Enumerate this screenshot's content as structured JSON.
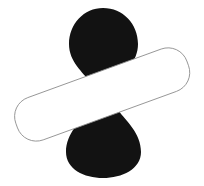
{
  "canvas": {
    "width": 204,
    "height": 186,
    "background_color": "#ffffff",
    "title": "Overlapping hourglass and rounded rectangle"
  },
  "shapes": [
    {
      "name": "hourglass",
      "label": "Black hourglass",
      "fill_color": "#121212",
      "stroke_color": "none",
      "stroke_width": 0,
      "center_x": 103,
      "center_y": 93,
      "top": 8,
      "bottom": 178,
      "bulb_left": 66,
      "bulb_right": 140,
      "waist_left": 89,
      "waist_right": 118,
      "waist_y": 93,
      "path": "M 103 8 C 123 8 138 24 138 44 C 138 62 124 72 117 82 C 113 88 112 90 112 95 C 112 101 114 104 118 110 C 126 121 141 133 141 152 C 141 169 122 178 103 178 C 84 178 66 169 66 152 C 66 133 81 121 89 110 C 93 104 95 101 95 95 C 95 90 94 88 90 82 C 83 72 69 62 69 44 C 69 24 84 8 103 8 Z"
    },
    {
      "name": "rounded-rectangle",
      "label": "Outlined rounded rectangle",
      "fill_color": "#ffffff",
      "stroke_color": "#8a8a8a",
      "stroke_width": 0.8,
      "rotation_deg": -20,
      "rect_x": 11,
      "rect_y": 72,
      "rect_width": 182,
      "rect_height": 45,
      "corner_radius": 20,
      "pivot_x": 102,
      "pivot_y": 94
    }
  ],
  "legend": {
    "hourglass_label": "Hourglass",
    "rectangle_label": "Rounded rectangle"
  }
}
